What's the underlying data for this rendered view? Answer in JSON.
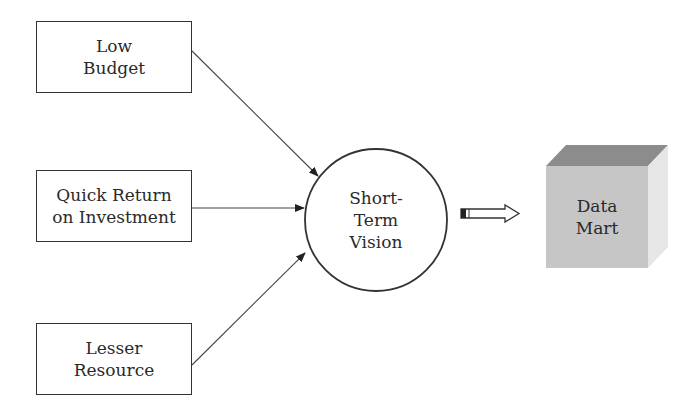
{
  "diagram": {
    "inputs": [
      {
        "id": "low-budget",
        "lines": [
          "Low",
          "Budget"
        ]
      },
      {
        "id": "quick-return",
        "lines": [
          "Quick Return",
          "on Investment"
        ]
      },
      {
        "id": "lesser-resource",
        "lines": [
          "Lesser",
          "Resource"
        ]
      }
    ],
    "center": {
      "lines": [
        "Short-",
        "Term",
        "Vision"
      ]
    },
    "output": {
      "lines": [
        "Data",
        "Mart"
      ]
    },
    "colors": {
      "stroke": "#333333",
      "cube_top": "#8c8c8c",
      "cube_front": "#c6c6c6",
      "cube_side": "#e6e6e6"
    }
  }
}
